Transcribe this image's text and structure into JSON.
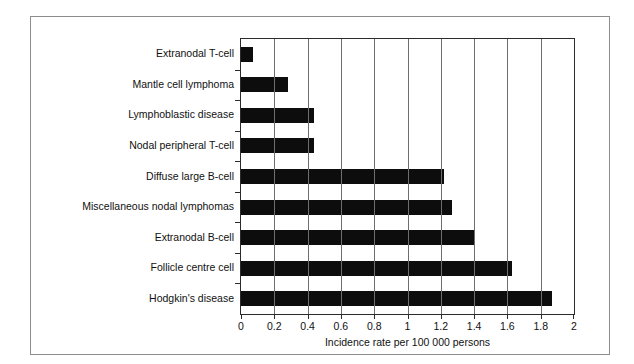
{
  "chart_data": {
    "type": "bar",
    "orientation": "horizontal",
    "title": "",
    "xlabel": "Incidence rate per 100 000 persons",
    "ylabel": "",
    "xlim": [
      0,
      2
    ],
    "xticks": [
      "0",
      "0.2",
      "0.4",
      "0.6",
      "0.8",
      "1",
      "1.2",
      "1.4",
      "1.6",
      "1.8",
      "2"
    ],
    "xtick_values": [
      0,
      0.2,
      0.4,
      0.6,
      0.8,
      1,
      1.2,
      1.4,
      1.6,
      1.8,
      2
    ],
    "grid": "vertical",
    "legend": "none",
    "bar_color": "#0d0d0d",
    "categories": [
      "Extranodal T-cell",
      "Mantle cell lymphoma",
      "Lymphoblastic disease",
      "Nodal peripheral T-cell",
      "Diffuse large B-cell",
      "Miscellaneous nodal lymphomas",
      "Extranodal B-cell",
      "Follicle centre cell",
      "Hodgkin's disease"
    ],
    "values": [
      0.07,
      0.28,
      0.44,
      0.44,
      1.22,
      1.27,
      1.4,
      1.63,
      1.87
    ]
  }
}
